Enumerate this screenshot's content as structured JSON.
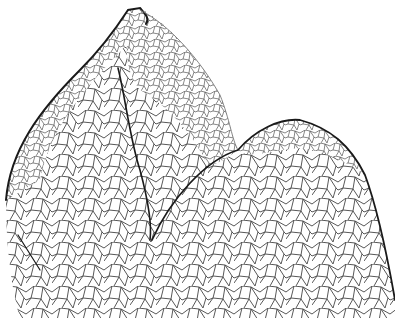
{
  "figure": {
    "background_color": "#ffffff",
    "line_color": "#333333",
    "outline_color": "#1a1a1a",
    "regions": [
      {
        "name": "left-lobe",
        "description": "tall leaf primordium on left"
      },
      {
        "name": "apex-dome",
        "description": "central dome with lighter cells"
      },
      {
        "name": "right-lobe",
        "description": "rounded lobe on right"
      }
    ]
  }
}
